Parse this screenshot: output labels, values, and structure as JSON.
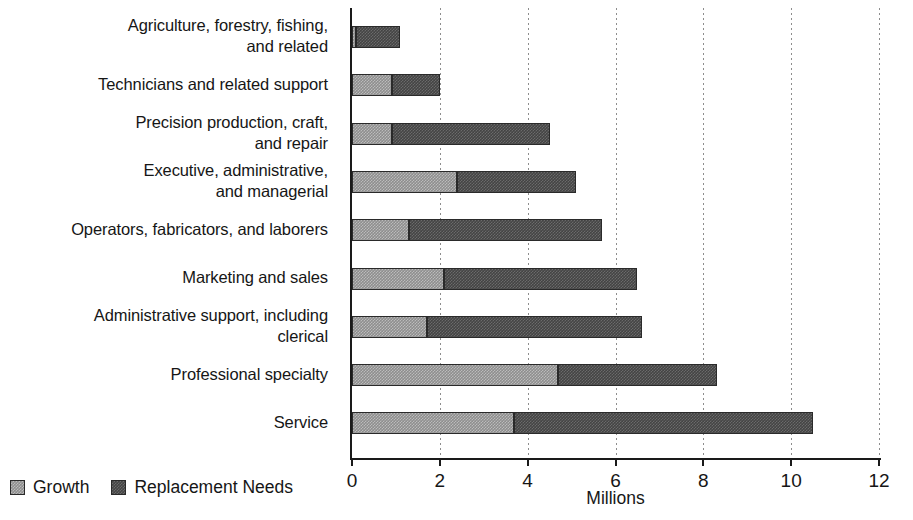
{
  "chart_data": {
    "type": "bar",
    "orientation": "horizontal",
    "stacked": true,
    "title": "",
    "xlabel": "Millions",
    "ylabel": "",
    "xlim": [
      0,
      12
    ],
    "xticks": [
      0,
      2,
      4,
      6,
      8,
      10,
      12
    ],
    "xtick_labels": [
      "0",
      "2",
      "4",
      "6",
      "8",
      "10",
      "12"
    ],
    "grid": "vertical-dotted",
    "legend_position": "bottom-left",
    "categories": [
      "Agriculture, forestry, fishing, and related",
      "Technicians and related support",
      "Precision production, craft, and repair",
      "Executive, administrative, and managerial",
      "Operators, fabricators, and laborers",
      "Marketing and sales",
      "Administrative support, including clerical",
      "Professional specialty",
      "Service"
    ],
    "category_label_lines": [
      [
        "Agriculture, forestry, fishing,",
        "and related"
      ],
      [
        "Technicians and related support"
      ],
      [
        "Precision production, craft,",
        "and repair"
      ],
      [
        "Executive, administrative,",
        "and managerial"
      ],
      [
        "Operators, fabricators, and laborers"
      ],
      [
        "Marketing and sales"
      ],
      [
        "Administrative support, including",
        "clerical"
      ],
      [
        "Professional specialty"
      ],
      [
        "Service"
      ]
    ],
    "series": [
      {
        "name": "Growth",
        "color": "#8e8e8e",
        "values": [
          0.1,
          0.9,
          0.9,
          2.4,
          1.3,
          2.1,
          1.7,
          4.7,
          3.7
        ]
      },
      {
        "name": "Replacement Needs",
        "color": "#444444",
        "values": [
          1.0,
          1.1,
          3.6,
          2.7,
          4.4,
          4.4,
          4.9,
          3.6,
          6.8
        ]
      }
    ],
    "totals": [
      1.1,
      2.0,
      4.5,
      5.1,
      5.7,
      6.5,
      6.6,
      8.3,
      10.5
    ]
  },
  "legend": {
    "items": [
      {
        "label": "Growth",
        "color": "#8e8e8e"
      },
      {
        "label": "Replacement Needs",
        "color": "#444444"
      }
    ]
  },
  "axis": {
    "x_title": "Millions"
  }
}
